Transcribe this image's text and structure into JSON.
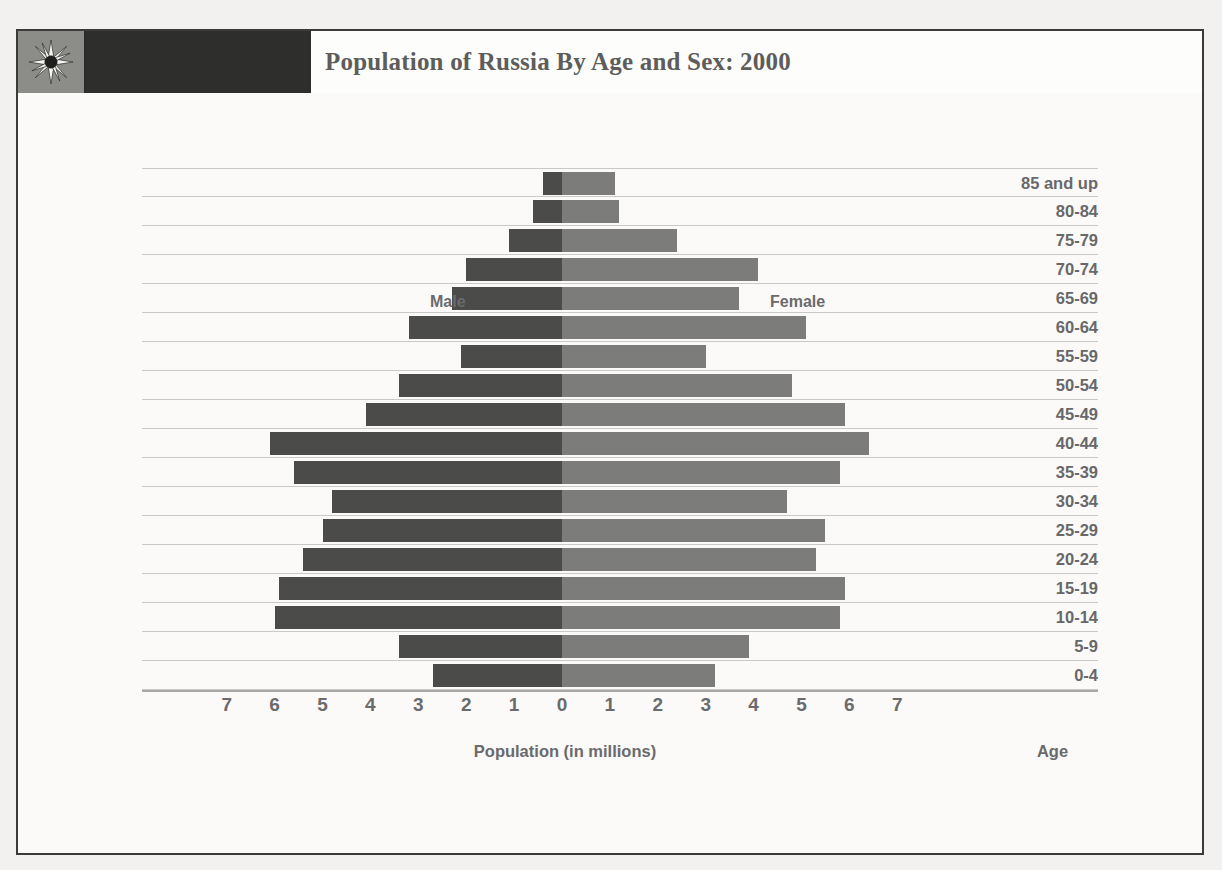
{
  "header": {
    "title": "Population of Russia By Age and Sex: 2000",
    "logo_icon": "sunburst-star-icon"
  },
  "labels": {
    "male": "Male",
    "female": "Female",
    "xaxis_title": "Population (in millions)",
    "age_column_title": "Age"
  },
  "colors": {
    "male_bar": "#4b4b49",
    "female_bar": "#7c7c7a",
    "title_bar_dark": "#2e2e2c",
    "logo_background": "#8c8c88",
    "gridline": "#c9c9c7",
    "text": "#6a6a6c"
  },
  "chart_data": {
    "type": "bar",
    "subtype": "population-pyramid",
    "title": "Population of Russia By Age and Sex: 2000",
    "xlabel": "Population (in millions)",
    "ylabel": "Age",
    "xlim": [
      -7.5,
      7.5
    ],
    "xticks": [
      7,
      6,
      5,
      4,
      3,
      2,
      1,
      0,
      1,
      2,
      3,
      4,
      5,
      6,
      7
    ],
    "xtick_values": [
      -7,
      -6,
      -5,
      -4,
      -3,
      -2,
      -1,
      0,
      1,
      2,
      3,
      4,
      5,
      6,
      7
    ],
    "grid": true,
    "legend": "in-plot",
    "categories": [
      "85 and up",
      "80-84",
      "75-79",
      "70-74",
      "65-69",
      "60-64",
      "55-59",
      "50-54",
      "45-49",
      "40-44",
      "35-39",
      "30-34",
      "25-29",
      "20-24",
      "15-19",
      "10-14",
      "5-9",
      "0-4"
    ],
    "series": [
      {
        "name": "Male",
        "values": [
          0.4,
          0.6,
          1.1,
          2.0,
          2.3,
          3.2,
          2.1,
          3.4,
          4.1,
          6.1,
          5.6,
          4.8,
          5.0,
          5.4,
          5.9,
          6.0,
          3.4,
          2.7
        ]
      },
      {
        "name": "Female",
        "values": [
          1.1,
          1.2,
          2.4,
          4.1,
          3.7,
          5.1,
          3.0,
          4.8,
          5.9,
          6.4,
          5.8,
          4.7,
          5.5,
          5.3,
          5.9,
          5.8,
          3.9,
          3.2
        ]
      }
    ]
  }
}
